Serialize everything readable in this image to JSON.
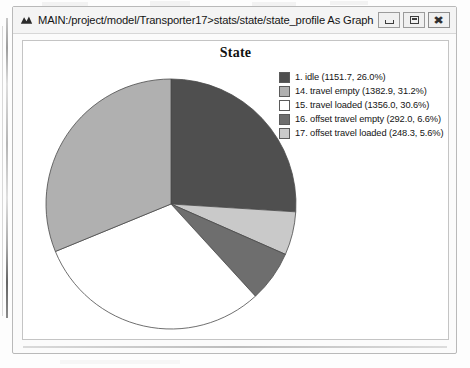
{
  "window": {
    "title": "MAIN:/project/model/Transporter17>stats/state/state_profile As Graph",
    "app_icon": "chart-icon",
    "buttons": {
      "minimize": "minimize-icon",
      "maximize": "maximize-icon",
      "close": "✖"
    }
  },
  "chart_data": {
    "type": "pie",
    "title": "State",
    "xlabel": "",
    "ylabel": "",
    "legend_position": "right",
    "start_angle_deg": 0,
    "direction": "clockwise",
    "total": 4430.9,
    "categories": [
      "1. idle",
      "14. travel empty",
      "15. travel loaded",
      "16. offset travel empty",
      "17. offset travel loaded"
    ],
    "values": [
      1151.7,
      1382.9,
      1356.0,
      292.0,
      248.3
    ],
    "percents": [
      26.0,
      31.2,
      30.6,
      6.6,
      5.6
    ],
    "colors": [
      "#4f4f4f",
      "#b0b0b0",
      "#ffffff",
      "#6e6e6e",
      "#c9c9c9"
    ],
    "draw_order": [
      {
        "label": "1. idle",
        "percent": 26.0,
        "color": "#4f4f4f"
      },
      {
        "label": "17. offset travel loaded",
        "percent": 5.6,
        "color": "#c9c9c9"
      },
      {
        "label": "16. offset travel empty",
        "percent": 6.6,
        "color": "#6e6e6e"
      },
      {
        "label": "15. travel loaded",
        "percent": 30.6,
        "color": "#ffffff"
      },
      {
        "label": "14. travel empty",
        "percent": 31.2,
        "color": "#b0b0b0"
      }
    ],
    "legend": [
      {
        "label": "1. idle (1151.7, 26.0%)",
        "color": "#4f4f4f"
      },
      {
        "label": "14. travel empty (1382.9, 31.2%)",
        "color": "#b0b0b0"
      },
      {
        "label": "15. travel loaded (1356.0, 30.6%)",
        "color": "#ffffff"
      },
      {
        "label": "16. offset travel empty (292.0, 6.6%)",
        "color": "#6e6e6e"
      },
      {
        "label": "17. offset travel loaded (248.3, 5.6%)",
        "color": "#c9c9c9"
      }
    ]
  }
}
